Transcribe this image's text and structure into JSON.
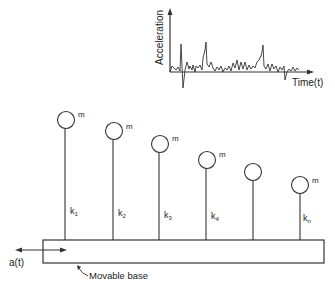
{
  "diagram": {
    "type": "mechanical-schematic",
    "inset_chart": {
      "ylabel": "Acceleration",
      "xlabel": "Time(t)"
    },
    "masses": [
      {
        "mass_label": "m",
        "spring_label": "k",
        "spring_sub": "1"
      },
      {
        "mass_label": "m",
        "spring_label": "k",
        "spring_sub": "2"
      },
      {
        "mass_label": "m",
        "spring_label": "k",
        "spring_sub": "3"
      },
      {
        "mass_label": "m",
        "spring_label": "k",
        "spring_sub": "4"
      },
      {
        "mass_label": "",
        "spring_label": "",
        "spring_sub": ""
      },
      {
        "mass_label": "m",
        "spring_label": "k",
        "spring_sub": "n"
      }
    ],
    "base_label": "Movable base",
    "excitation_label": "a(t)",
    "colors": {
      "line": "#333333",
      "background": "#ffffff"
    }
  }
}
